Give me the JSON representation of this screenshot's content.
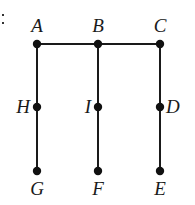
{
  "diagram": {
    "type": "graph",
    "prefix_mark": ":",
    "colors": {
      "line": "#1a1a1a",
      "node": "#111111",
      "label": "#1a1a1a",
      "background": "#ffffff"
    },
    "nodes": [
      {
        "id": "A",
        "label": "A",
        "x": 37,
        "y": 44,
        "label_pos": "above"
      },
      {
        "id": "B",
        "label": "B",
        "x": 98,
        "y": 44,
        "label_pos": "above"
      },
      {
        "id": "C",
        "label": "C",
        "x": 160,
        "y": 44,
        "label_pos": "above"
      },
      {
        "id": "H",
        "label": "H",
        "x": 37,
        "y": 107,
        "label_pos": "left"
      },
      {
        "id": "I",
        "label": "I",
        "x": 98,
        "y": 107,
        "label_pos": "left"
      },
      {
        "id": "D",
        "label": "D",
        "x": 160,
        "y": 107,
        "label_pos": "right"
      },
      {
        "id": "G",
        "label": "G",
        "x": 37,
        "y": 171,
        "label_pos": "below"
      },
      {
        "id": "F",
        "label": "F",
        "x": 98,
        "y": 171,
        "label_pos": "below"
      },
      {
        "id": "E",
        "label": "E",
        "x": 160,
        "y": 171,
        "label_pos": "below"
      }
    ],
    "edges": [
      {
        "from": "A",
        "to": "B"
      },
      {
        "from": "B",
        "to": "C"
      },
      {
        "from": "A",
        "to": "H"
      },
      {
        "from": "H",
        "to": "G"
      },
      {
        "from": "B",
        "to": "I"
      },
      {
        "from": "I",
        "to": "F"
      },
      {
        "from": "C",
        "to": "D"
      },
      {
        "from": "D",
        "to": "E"
      }
    ]
  }
}
